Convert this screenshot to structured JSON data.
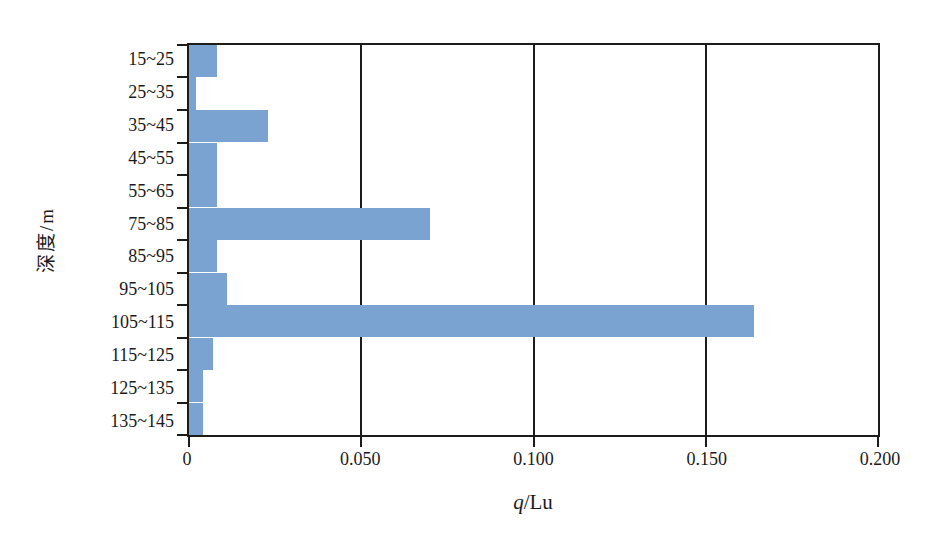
{
  "chart_data": {
    "type": "bar",
    "orientation": "horizontal",
    "title": "",
    "xlabel": "q/Lu",
    "xlabel_parts": {
      "symbol": "q",
      "unit": "/Lu"
    },
    "ylabel": "深度/m",
    "categories": [
      "15~25",
      "25~35",
      "35~45",
      "45~55",
      "55~65",
      "75~85",
      "85~95",
      "95~105",
      "105~115",
      "115~125",
      "125~135",
      "135~145"
    ],
    "values": [
      0.008,
      0.002,
      0.023,
      0.008,
      0.008,
      0.07,
      0.008,
      0.011,
      0.164,
      0.007,
      0.004,
      0.004
    ],
    "xlim": [
      0,
      0.2
    ],
    "xticks": [
      0,
      0.05,
      0.1,
      0.15,
      0.2
    ],
    "xtick_labels": [
      "0",
      "0.050",
      "0.100",
      "0.150",
      "0.200"
    ],
    "grid": "vertical gridlines at x ticks, frame border on all sides",
    "legend": "none",
    "bar_gap": 0,
    "bar_color": "#7AA3D2",
    "axis_color": "#1C1C1C",
    "background_color": "#FFFFFF"
  }
}
